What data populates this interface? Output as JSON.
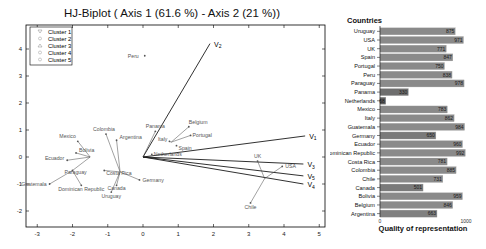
{
  "chart_data": [
    {
      "type": "scatter",
      "title": "HJ-Biplot ( Axis 1 (61.6 %) - Axis 2 (21 %))",
      "xlabel": "",
      "ylabel": "",
      "xlim": [
        -3.3,
        5.2
      ],
      "ylim": [
        -2.6,
        4.9
      ],
      "xticks": [
        -3,
        -2,
        -1,
        0,
        1,
        2,
        3,
        4,
        5
      ],
      "yticks": [
        -2,
        -1,
        0,
        1,
        2,
        3,
        4
      ],
      "grid": false,
      "legend": {
        "position": "upper-left",
        "entries": [
          "Cluster 1",
          "Cluster 2",
          "Cluster 3",
          "Cluster 4",
          "Cluster 5"
        ],
        "markers": [
          "triangle-down",
          "circle",
          "triangle-up",
          "circle",
          "circle"
        ]
      },
      "variables": [
        {
          "name": "V1",
          "label_main": "V",
          "label_sub": "1",
          "x": 4.6,
          "y": 0.78
        },
        {
          "name": "V2",
          "label_main": "V",
          "label_sub": "2",
          "x": 1.9,
          "y": 4.2
        },
        {
          "name": "V3",
          "label_main": "V",
          "label_sub": "3",
          "x": 4.55,
          "y": -0.26
        },
        {
          "name": "V4",
          "label_main": "V",
          "label_sub": "4",
          "x": 4.55,
          "y": -1.0
        },
        {
          "name": "V5",
          "label_main": "V",
          "label_sub": "5",
          "x": 4.55,
          "y": -0.7
        }
      ],
      "points": [
        {
          "label": "Peru",
          "x": 0.05,
          "y": 3.75
        },
        {
          "label": "Panama",
          "x": 0.35,
          "y": 0.95
        },
        {
          "label": "Belgium",
          "x": 1.3,
          "y": 1.12
        },
        {
          "label": "Portugal",
          "x": 1.35,
          "y": 0.8
        },
        {
          "label": "Italy",
          "x": 0.75,
          "y": 0.58
        },
        {
          "label": "Spain",
          "x": 0.95,
          "y": 0.42
        },
        {
          "label": "Netherlands",
          "x": 0.25,
          "y": 0.1
        },
        {
          "label": "Argentina",
          "x": -0.75,
          "y": 0.62
        },
        {
          "label": "Colombia",
          "x": -1.05,
          "y": 0.85
        },
        {
          "label": "Mexico",
          "x": -1.85,
          "y": 0.58
        },
        {
          "label": "Bolivia",
          "x": -1.9,
          "y": 0.15
        },
        {
          "label": "Ecuador",
          "x": -2.15,
          "y": -0.12
        },
        {
          "label": "Paraguay",
          "x": -2.0,
          "y": -0.5
        },
        {
          "label": "Guatemala",
          "x": -2.65,
          "y": -1.0
        },
        {
          "label": "Dominican Republic",
          "x": -1.75,
          "y": -1.05
        },
        {
          "label": "Costa Rica",
          "x": -1.1,
          "y": -0.5
        },
        {
          "label": "Germany",
          "x": -0.1,
          "y": -0.85
        },
        {
          "label": "Canada",
          "x": -0.75,
          "y": -1.05
        },
        {
          "label": "Uruguay",
          "x": -0.9,
          "y": -1.3
        },
        {
          "label": "UK",
          "x": 3.25,
          "y": -0.15
        },
        {
          "label": "USA",
          "x": 3.95,
          "y": -0.35
        },
        {
          "label": "Chile",
          "x": 3.05,
          "y": -1.7
        }
      ]
    },
    {
      "type": "bar",
      "orientation": "horizontal",
      "title": "Countries",
      "xlabel": "Quality of representation",
      "ylabel": "",
      "xlim": [
        0,
        1000
      ],
      "xticks": [
        "0",
        "1000"
      ],
      "categories": [
        "Uruguay",
        "USA",
        "UK",
        "Spain",
        "Portugal",
        "Peru",
        "Paraguay",
        "Panama",
        "Netherlands",
        "Mexico",
        "Italy",
        "Guatemala",
        "Germany",
        "Ecuador",
        "Dominican Republic",
        "Costa Rica",
        "Colombia",
        "Chile",
        "Canada",
        "Bolivia",
        "Belgium",
        "Argentina"
      ],
      "values": [
        875,
        971,
        771,
        847,
        750,
        838,
        978,
        330,
        68,
        783,
        862,
        984,
        650,
        960,
        992,
        781,
        885,
        731,
        501,
        959,
        846,
        663
      ],
      "bar_colors": [
        "#8a8a8a",
        "#8a8a8a",
        "#8a8a8a",
        "#8a8a8a",
        "#8a8a8a",
        "#8a8a8a",
        "#8a8a8a",
        "#6e6e6e",
        "#5f5f5f",
        "#8a8a8a",
        "#8a8a8a",
        "#8a8a8a",
        "#7a7a7a",
        "#8a8a8a",
        "#8a8a8a",
        "#8a8a8a",
        "#8a8a8a",
        "#8a8a8a",
        "#7a7a7a",
        "#8a8a8a",
        "#8a8a8a",
        "#808080"
      ]
    }
  ],
  "colors": {
    "axis": "#000000",
    "bar": "#8a8a8a",
    "bar_border": "#b0b0b0",
    "vector": "#1a1a1a",
    "point_line": "#444444",
    "text": "#222222"
  }
}
